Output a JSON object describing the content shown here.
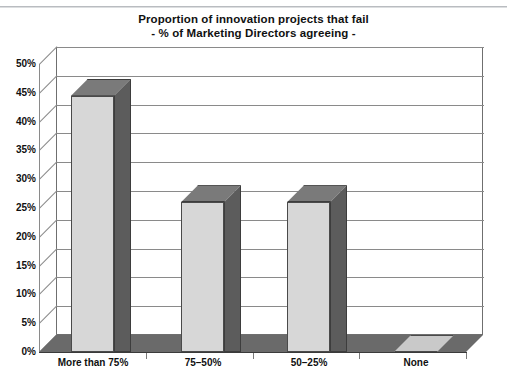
{
  "chart_data": {
    "type": "bar",
    "title": "Proportion of innovation projects that fail",
    "subtitle": "- % of Marketing Directors agreeing -",
    "xlabel": "",
    "ylabel": "",
    "categories": [
      "More than 75%",
      "75–50%",
      "50–25%",
      "None"
    ],
    "values": [
      44.5,
      26.0,
      26.0,
      0.0
    ],
    "value_labels": [
      "44.5%",
      "26%",
      "26%",
      "0%"
    ],
    "ylim": [
      0,
      50
    ],
    "ytick_step": 5,
    "yticks": [
      "0%",
      "5%",
      "10%",
      "15%",
      "20%",
      "25%",
      "30%",
      "35%",
      "40%",
      "45%",
      "50%"
    ],
    "ytick_values": [
      0,
      5,
      10,
      15,
      20,
      25,
      30,
      35,
      40,
      45,
      50
    ],
    "grid": true,
    "legend": "none",
    "style": "3d-column",
    "colors": {
      "bar_front": "#d7d7d7",
      "bar_side": "#5c5c5c",
      "bar_top": "#7a7a7a",
      "bar_outline": "#4a4a4a",
      "floor": "#6a6a6a",
      "zero_bar_plate": "#c9c9c9",
      "gridline": "#8a8a8a",
      "plot_border": "#6f6f6f",
      "background": "#ffffff",
      "text": "#101010"
    }
  }
}
